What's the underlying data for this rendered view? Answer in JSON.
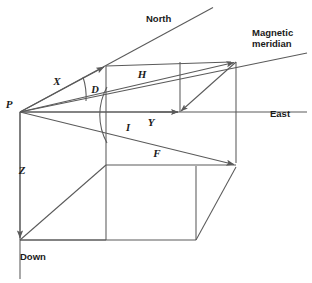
{
  "figure": {
    "background_color": "#ffffff",
    "line_color": "#5a5a5a",
    "text_color": "#1a1a1a"
  },
  "axes": [
    {
      "id": "north",
      "label": "North",
      "label_x": 146,
      "label_y": 22,
      "from": [
        20,
        112
      ],
      "to": [
        212,
        8
      ]
    },
    {
      "id": "east",
      "label": "East",
      "label_x": 270,
      "label_y": 117,
      "from": [
        20,
        112
      ],
      "to": [
        306,
        112
      ]
    },
    {
      "id": "down",
      "label": "Down",
      "label_x": 20,
      "label_y": 260,
      "from": [
        20,
        112
      ],
      "to": [
        20,
        278
      ]
    },
    {
      "id": "magnetic-meridian",
      "label": "Magnetic meridian",
      "label_line_1": "Magnetic",
      "label_line_2": "meridian",
      "label_x": 252,
      "label_y": 36,
      "from": [
        20,
        112
      ],
      "to": [
        306,
        54
      ]
    }
  ],
  "vectors": [
    {
      "id": "x-component",
      "label": "X",
      "label_x": 57,
      "label_y": 85,
      "description": "North component",
      "from": [
        20,
        112
      ],
      "to": [
        106,
        66
      ]
    },
    {
      "id": "h-component",
      "label": "H",
      "label_x": 142,
      "label_y": 78,
      "description": "Horizontal component",
      "from": [
        20,
        112
      ],
      "to": [
        236,
        62
      ]
    },
    {
      "id": "y-component",
      "label": "Y",
      "label_x": 151,
      "label_y": 126,
      "description": "East component",
      "from": [
        20,
        112
      ],
      "to": [
        180,
        112
      ]
    },
    {
      "id": "f-total-field",
      "label": "F",
      "label_x": 157,
      "label_y": 157,
      "description": "Total field intensity",
      "from": [
        20,
        112
      ],
      "to": [
        236,
        165
      ]
    },
    {
      "id": "z-component",
      "label": "Z",
      "label_x": 22,
      "label_y": 174,
      "description": "Vertical component",
      "from": [
        20,
        112
      ],
      "to": [
        20,
        240
      ]
    }
  ],
  "angles": [
    {
      "id": "declination",
      "label": "D",
      "label_x": 95,
      "label_y": 93,
      "description": "Declination, angle between North and magnetic meridian"
    },
    {
      "id": "inclination",
      "label": "I",
      "label_x": 128,
      "label_y": 131,
      "description": "Inclination, angle between horizontal H and total field F"
    }
  ],
  "points": [
    {
      "id": "origin",
      "label": "P",
      "label_x": 9,
      "label_y": 108,
      "x": 20,
      "y": 112
    }
  ]
}
